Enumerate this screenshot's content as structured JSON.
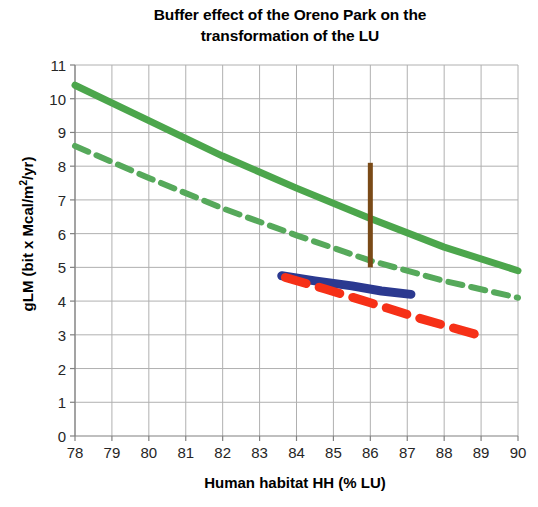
{
  "chart_data": {
    "type": "line",
    "title": "Buffer effect of the Oreno Park on the transformation of the LU",
    "title_line1": "Buffer effect of the Oreno Park on the",
    "title_line2": "transformation of the LU",
    "xlabel": "Human habitat HH (% LU)",
    "ylabel_prefix": "gLM (bit x Mcal/m",
    "ylabel_sup": "2",
    "ylabel_suffix": "/yr)",
    "ylabel": "gLM (bit x Mcal/m2/yr)",
    "xlim": [
      78,
      90
    ],
    "ylim": [
      0,
      11
    ],
    "grid": true,
    "legend": "none",
    "x_ticks": [
      78,
      79,
      80,
      81,
      82,
      83,
      84,
      85,
      86,
      87,
      88,
      89,
      90
    ],
    "y_ticks": [
      0,
      1,
      2,
      3,
      4,
      5,
      6,
      7,
      8,
      9,
      10,
      11
    ],
    "series": [
      {
        "name": "green-solid-upper-trend",
        "color": "#4CA64C",
        "style": "solid",
        "width": 7,
        "x": [
          78,
          80,
          82,
          84,
          86,
          88,
          90
        ],
        "values": [
          10.4,
          9.35,
          8.3,
          7.35,
          6.45,
          5.6,
          4.9
        ]
      },
      {
        "name": "green-dashed-lower-trend",
        "color": "#56A95B",
        "style": "dashed",
        "width": 6,
        "x": [
          78,
          80,
          82,
          84,
          86,
          88,
          90
        ],
        "values": [
          8.6,
          7.65,
          6.75,
          5.95,
          5.2,
          4.6,
          4.1
        ]
      },
      {
        "name": "blue-solid-segment",
        "color": "#2B3990",
        "style": "solid",
        "width": 9,
        "x": [
          83.6,
          84.5,
          85.5,
          86.3,
          87.1
        ],
        "values": [
          4.75,
          4.6,
          4.45,
          4.3,
          4.2
        ]
      },
      {
        "name": "red-dashed-segment",
        "color": "#F63017",
        "style": "dashed",
        "width": 9,
        "x": [
          83.7,
          84.8,
          86.0,
          87.3,
          88.9
        ],
        "values": [
          4.7,
          4.35,
          3.95,
          3.5,
          3.0
        ]
      }
    ],
    "annotations": [
      {
        "name": "brown-vertical-bar",
        "color": "#7A4A17",
        "x": 86.0,
        "y_top": 8.1,
        "y_bottom": 5.0,
        "width": 5
      }
    ]
  }
}
